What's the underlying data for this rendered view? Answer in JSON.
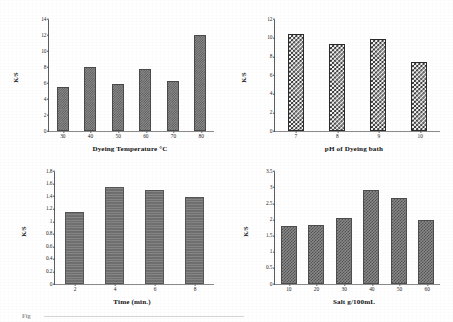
{
  "figure": {
    "background_color": "#ffffff",
    "panel_count": 4,
    "caption_fragment": "Fig"
  },
  "chart_data": [
    {
      "id": "dyeing-temperature",
      "type": "bar",
      "title": "",
      "xlabel": "Dyeing Temperature  °C",
      "ylabel": "K/S",
      "categories": [
        "30",
        "40",
        "50",
        "60",
        "70",
        "80"
      ],
      "values": [
        5.5,
        8.0,
        5.9,
        7.7,
        6.2,
        12.0
      ],
      "ylim": [
        0,
        14
      ],
      "yticks": [
        "0",
        "2",
        "4",
        "6",
        "8",
        "10",
        "12",
        "14"
      ],
      "ytick_values": [
        0,
        2,
        4,
        6,
        8,
        10,
        12,
        14
      ],
      "grid": false,
      "legend": "none",
      "bar_pattern": "fine-checker",
      "bar_color": "#7d7d7d"
    },
    {
      "id": "ph-of-dyeing-bath",
      "type": "bar",
      "title": "",
      "xlabel": "pH  of Dyeing bath",
      "ylabel": "K/S",
      "categories": [
        "7",
        "8",
        "9",
        "10"
      ],
      "values": [
        10.4,
        9.3,
        9.9,
        7.4
      ],
      "ylim": [
        0,
        12
      ],
      "yticks": [
        "0",
        "2",
        "4",
        "6",
        "8",
        "10",
        "12"
      ],
      "ytick_values": [
        0,
        2,
        4,
        6,
        8,
        10,
        12
      ],
      "grid": false,
      "legend": "none",
      "bar_pattern": "coarse-checkerboard",
      "bar_color": "#2e2e2e"
    },
    {
      "id": "time-minutes",
      "type": "bar",
      "title": "",
      "xlabel": "Time (min.)",
      "ylabel": "K/S",
      "categories": [
        "2",
        "4",
        "6",
        "8"
      ],
      "values": [
        1.15,
        1.54,
        1.49,
        1.38
      ],
      "ylim": [
        0,
        1.8
      ],
      "yticks": [
        "0",
        "0.2",
        "0.4",
        "0.6",
        "0.8",
        "1",
        "1.2",
        "1.4",
        "1.6",
        "1.8"
      ],
      "ytick_values": [
        0,
        0.2,
        0.4,
        0.6,
        0.8,
        1.0,
        1.2,
        1.4,
        1.6,
        1.8
      ],
      "grid": false,
      "legend": "none",
      "bar_pattern": "solid-ruled",
      "bar_color": "#6f6f6f"
    },
    {
      "id": "salt-concentration",
      "type": "bar",
      "title": "",
      "xlabel": "Salt g/100mL",
      "ylabel": "K/S",
      "categories": [
        "10",
        "20",
        "30",
        "40",
        "50",
        "60"
      ],
      "values": [
        1.8,
        1.83,
        2.03,
        2.9,
        2.67,
        1.97
      ],
      "ylim": [
        0,
        3.5
      ],
      "yticks": [
        "0",
        "0.5",
        "1",
        "1.5",
        "2",
        "2.5",
        "3",
        "3.5"
      ],
      "ytick_values": [
        0,
        0.5,
        1.0,
        1.5,
        2.0,
        2.5,
        3.0,
        3.5
      ],
      "grid": false,
      "legend": "none",
      "bar_pattern": "medium-checker",
      "bar_color": "#8a8a8a"
    }
  ]
}
